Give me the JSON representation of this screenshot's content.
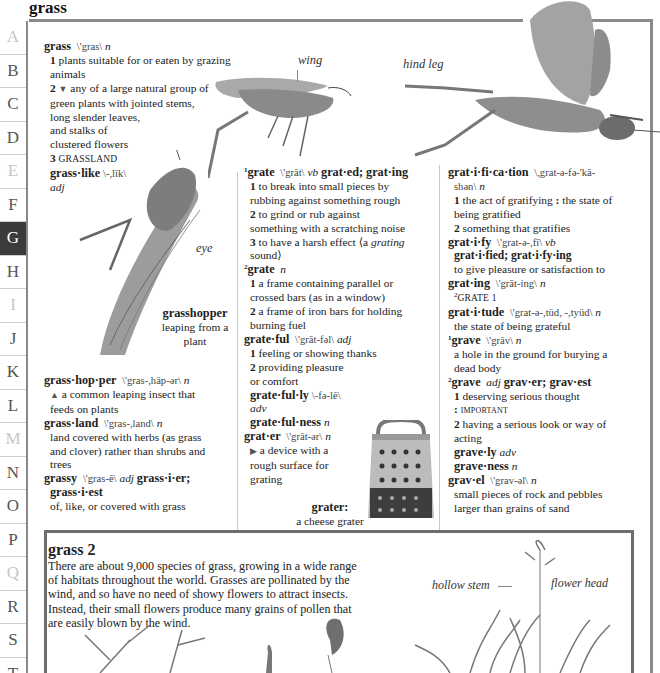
{
  "page": {
    "title": "grass"
  },
  "sidebar": {
    "tabs": [
      {
        "letter": "A",
        "dim": true
      },
      {
        "letter": "B",
        "dim": false
      },
      {
        "letter": "C",
        "dim": false
      },
      {
        "letter": "D",
        "dim": false
      },
      {
        "letter": "E",
        "dim": true
      },
      {
        "letter": "F",
        "dim": false
      },
      {
        "letter": "G",
        "active": true
      },
      {
        "letter": "H",
        "dim": false
      },
      {
        "letter": "I",
        "dim": true
      },
      {
        "letter": "J",
        "dim": false
      },
      {
        "letter": "K",
        "dim": false
      },
      {
        "letter": "L",
        "dim": false
      },
      {
        "letter": "M",
        "dim": true
      },
      {
        "letter": "N",
        "dim": false
      },
      {
        "letter": "O",
        "dim": false
      },
      {
        "letter": "P",
        "dim": false
      },
      {
        "letter": "Q",
        "dim": true
      },
      {
        "letter": "R",
        "dim": false
      },
      {
        "letter": "S",
        "dim": false
      },
      {
        "letter": "T",
        "dim": false
      }
    ]
  },
  "entries": {
    "grass": {
      "headword": "grass",
      "pron": "\\'gras\\",
      "pos": "n",
      "s1_num": "1",
      "s1": "plants suitable for or eaten by grazing animals",
      "s2_num": "2",
      "s2_marker": "▼",
      "s2a": "any of a large natural group of",
      "s2b": "green plants with jointed stems,",
      "s2c": "long slender leaves,",
      "s2d": "and stalks of",
      "s2e": "clustered flowers",
      "s3_num": "3",
      "s3": "grassland",
      "derived": "grass·like",
      "derived_pron": "\\-,līk\\",
      "derived_pos": "adj"
    },
    "grasshopper": {
      "headword": "grass·hop·per",
      "pron": "\\'gras-,häp-ər\\",
      "pos": "n",
      "marker": "▲",
      "def1": "a common leaping insect that",
      "def2": "feeds on plants"
    },
    "grassland": {
      "headword": "grass·land",
      "pron": "\\'gras-,land\\",
      "pos": "n",
      "def1": "land covered with herbs (as grass",
      "def2": "and clover) rather than shrubs and",
      "def3": "trees"
    },
    "grassy": {
      "headword": "grassy",
      "pron": "\\'gras-ē\\",
      "pos": "adj",
      "forms1": "grass·i·er;",
      "forms2": "grass·i·est",
      "def": "of, like, or covered with grass"
    },
    "grate1": {
      "sup": "1",
      "headword": "grate",
      "pron": "\\'grāt\\",
      "pos": "vb",
      "forms": "grat·ed; grat·ing",
      "s1_num": "1",
      "s1a": "to break into small pieces by",
      "s1b": "rubbing against something rough",
      "s2_num": "2",
      "s2a": "to grind or rub against",
      "s2b": "something with a scratching noise",
      "s3_num": "3",
      "s3a": "to have a harsh effect",
      "s3_example_pre": "⟨a ",
      "s3_example_it": "grating",
      "s3b": "sound⟩"
    },
    "grate2": {
      "sup": "2",
      "headword": "grate",
      "pos": "n",
      "s1_num": "1",
      "s1a": "a frame containing parallel or",
      "s1b": "crossed bars (as in a window)",
      "s2_num": "2",
      "s2a": "a frame of iron bars for holding",
      "s2b": "burning fuel"
    },
    "grateful": {
      "headword": "grate·ful",
      "pron": "\\'grāt-fəl\\",
      "pos": "adj",
      "s1_num": "1",
      "s1": "feeling or showing thanks",
      "s2_num": "2",
      "s2a": "providing pleasure",
      "s2b": "or comfort",
      "d1": "grate·ful·ly",
      "d1_pron": "\\-fə-lē\\",
      "d1_pos": "adv",
      "d2": "grate·ful·ness",
      "d2_pos": "n"
    },
    "grater": {
      "headword": "grat·er",
      "pron": "\\'grāt-ər\\",
      "pos": "n",
      "marker": "▶",
      "def1": "a device with a",
      "def2": "rough surface for",
      "def3": "grating"
    },
    "gratification": {
      "headword": "grat·i·fi·ca·tion",
      "pron1": "\\,grat-ə-fə-'kā-",
      "pron2": "shən\\",
      "pos": "n",
      "s1_num": "1",
      "s1a": "the act of gratifying",
      "s1_colon": ":",
      "s1b": "the state of",
      "s1c": "being gratified",
      "s2_num": "2",
      "s2": "something that gratifies"
    },
    "gratify": {
      "headword": "grat·i·fy",
      "pron": "\\'grat-ə-,fī\\",
      "pos": "vb",
      "forms": "grat·i·fied; grat·i·fy·ing",
      "def": "to give pleasure or satisfaction to"
    },
    "grating": {
      "headword": "grat·ing",
      "pron": "\\'grāt-ing\\",
      "pos": "n",
      "xref_sup": "2",
      "xref": "grate 1"
    },
    "gratitude": {
      "headword": "grat·i·tude",
      "pron": "\\'grat-ə-,tüd, -,tyüd\\",
      "pos": "n",
      "def": "the state of being grateful"
    },
    "grave1": {
      "sup": "1",
      "headword": "grave",
      "pron": "\\'grāv\\",
      "pos": "n",
      "def1": "a hole in the ground for burying a",
      "def2": "dead body"
    },
    "grave2": {
      "sup": "2",
      "headword": "grave",
      "pos": "adj",
      "forms": "grav·er; grav·est",
      "s1_num": "1",
      "s1": "deserving serious thought",
      "s1_colon": ":",
      "s1_xref": "important",
      "s2_num": "2",
      "s2a": "having a serious look or way of",
      "s2b": "acting",
      "d1": "grave·ly",
      "d1_pos": "adv",
      "d2": "grave·ness",
      "d2_pos": "n"
    },
    "gravel": {
      "headword": "grav·el",
      "pron": "\\'grav-əl\\",
      "pos": "n",
      "def1": "small pieces of rock and pebbles",
      "def2": "larger than grains of sand"
    }
  },
  "illustrations": {
    "grasshopper_labels": {
      "wing": "wing",
      "hind_leg": "hind leg",
      "eye": "eye"
    },
    "grasshopper_caption": {
      "title": "grasshopper",
      "line1": "leaping from a",
      "line2": "plant"
    },
    "grater_caption": {
      "title": "grater:",
      "line1": "a cheese grater"
    },
    "grass_labels": {
      "hollow_stem": "hollow stem",
      "flower_head": "flower head"
    }
  },
  "feature_box": {
    "title": "grass 2",
    "line1": "There are about 9,000 species of grass, growing in a wide range",
    "line2": "of habitats throughout the world. Grasses are pollinated by the",
    "line3": "wind, and so have no need of showy flowers to attract insects.",
    "line4": "Instead, their small flowers produce many grains of pollen that",
    "line5": "are easily blown by the wind."
  }
}
